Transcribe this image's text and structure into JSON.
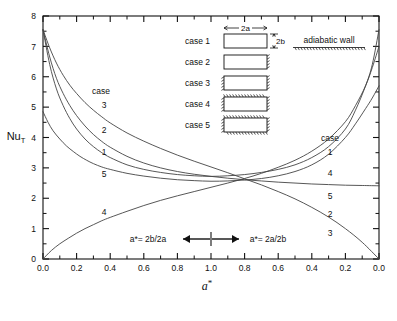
{
  "chart_data": {
    "type": "line",
    "title": "",
    "xlabel": "a*",
    "ylabel": "Nu_T",
    "ylim": [
      0,
      8
    ],
    "xlim": [
      0,
      2
    ],
    "grid": false,
    "legend_position": "on-curve-labels",
    "y_ticks": [
      "0",
      "1",
      "2",
      "3",
      "4",
      "5",
      "6",
      "7",
      "8"
    ],
    "y_tick_values": [
      0,
      1,
      2,
      3,
      4,
      5,
      6,
      7,
      8
    ],
    "x_ticks": [
      "0.0",
      "0.2",
      "0.4",
      "0.6",
      "0.8",
      "1.0",
      "0.8",
      "0.6",
      "0.4",
      "0.2",
      "0.0"
    ],
    "x_tick_values": [
      0.0,
      0.2,
      0.4,
      0.6,
      0.8,
      1.0,
      1.2,
      1.4,
      1.6,
      1.8,
      2.0
    ],
    "axis_note_left": "a*= 2b/2a",
    "axis_note_right": "a*= 2a/2b",
    "series": [
      {
        "name": "case 1",
        "label_left": "1",
        "label_right": "1",
        "points": [
          [
            0.0,
            7.55
          ],
          [
            0.04,
            6.4
          ],
          [
            0.08,
            5.6
          ],
          [
            0.12,
            5.05
          ],
          [
            0.16,
            4.62
          ],
          [
            0.2,
            4.28
          ],
          [
            0.25,
            3.95
          ],
          [
            0.3,
            3.7
          ],
          [
            0.35,
            3.5
          ],
          [
            0.4,
            3.34
          ],
          [
            0.5,
            3.1
          ],
          [
            0.6,
            2.95
          ],
          [
            0.7,
            2.85
          ],
          [
            0.8,
            2.78
          ],
          [
            0.9,
            2.74
          ],
          [
            1.0,
            2.72
          ],
          [
            1.1,
            2.74
          ],
          [
            1.2,
            2.78
          ],
          [
            1.3,
            2.85
          ],
          [
            1.4,
            2.95
          ],
          [
            1.5,
            3.1
          ],
          [
            1.6,
            3.34
          ],
          [
            1.7,
            3.7
          ],
          [
            1.8,
            4.28
          ],
          [
            1.86,
            4.9
          ],
          [
            1.92,
            5.7
          ],
          [
            1.96,
            6.4
          ],
          [
            2.0,
            7.55
          ]
        ]
      },
      {
        "name": "case 2",
        "label_left": "2",
        "label_right": "2",
        "points": [
          [
            0.0,
            7.55
          ],
          [
            0.04,
            6.65
          ],
          [
            0.08,
            5.95
          ],
          [
            0.12,
            5.45
          ],
          [
            0.16,
            5.05
          ],
          [
            0.2,
            4.72
          ],
          [
            0.25,
            4.38
          ],
          [
            0.3,
            4.1
          ],
          [
            0.35,
            3.87
          ],
          [
            0.4,
            3.68
          ],
          [
            0.5,
            3.38
          ],
          [
            0.6,
            3.16
          ],
          [
            0.7,
            3.0
          ],
          [
            0.8,
            2.88
          ],
          [
            0.9,
            2.79
          ],
          [
            1.0,
            2.72
          ],
          [
            1.1,
            2.66
          ],
          [
            1.2,
            2.61
          ],
          [
            1.3,
            2.57
          ],
          [
            1.4,
            2.53
          ],
          [
            1.5,
            2.5
          ],
          [
            1.6,
            2.47
          ],
          [
            1.7,
            2.45
          ],
          [
            1.8,
            2.43
          ],
          [
            1.9,
            2.42
          ],
          [
            2.0,
            2.41
          ]
        ]
      },
      {
        "name": "case 3",
        "label_left": "3",
        "label_right": "3",
        "points": [
          [
            0.0,
            7.55
          ],
          [
            0.04,
            6.95
          ],
          [
            0.08,
            6.45
          ],
          [
            0.12,
            6.05
          ],
          [
            0.16,
            5.72
          ],
          [
            0.2,
            5.45
          ],
          [
            0.25,
            5.15
          ],
          [
            0.3,
            4.9
          ],
          [
            0.35,
            4.68
          ],
          [
            0.4,
            4.48
          ],
          [
            0.5,
            4.15
          ],
          [
            0.6,
            3.88
          ],
          [
            0.7,
            3.64
          ],
          [
            0.8,
            3.42
          ],
          [
            0.9,
            3.22
          ],
          [
            1.0,
            3.03
          ],
          [
            1.1,
            2.84
          ],
          [
            1.2,
            2.64
          ],
          [
            1.3,
            2.44
          ],
          [
            1.4,
            2.22
          ],
          [
            1.5,
            1.98
          ],
          [
            1.6,
            1.7
          ],
          [
            1.7,
            1.38
          ],
          [
            1.8,
            1.0
          ],
          [
            1.9,
            0.55
          ],
          [
            2.0,
            0.0
          ]
        ]
      },
      {
        "name": "case 4",
        "label_left": "4",
        "label_right": "4",
        "points": [
          [
            0.0,
            0.0
          ],
          [
            0.05,
            0.28
          ],
          [
            0.1,
            0.5
          ],
          [
            0.15,
            0.68
          ],
          [
            0.2,
            0.85
          ],
          [
            0.25,
            1.0
          ],
          [
            0.3,
            1.13
          ],
          [
            0.35,
            1.26
          ],
          [
            0.4,
            1.37
          ],
          [
            0.5,
            1.57
          ],
          [
            0.6,
            1.76
          ],
          [
            0.7,
            1.93
          ],
          [
            0.8,
            2.08
          ],
          [
            0.9,
            2.22
          ],
          [
            1.0,
            2.36
          ],
          [
            1.1,
            2.5
          ],
          [
            1.2,
            2.65
          ],
          [
            1.3,
            2.82
          ],
          [
            1.4,
            3.02
          ],
          [
            1.5,
            3.25
          ],
          [
            1.6,
            3.55
          ],
          [
            1.7,
            3.95
          ],
          [
            1.8,
            4.52
          ],
          [
            1.86,
            5.05
          ],
          [
            1.92,
            5.7
          ],
          [
            1.96,
            6.3
          ],
          [
            2.0,
            7.0
          ]
        ]
      },
      {
        "name": "case 5",
        "label_left": "5",
        "label_right": "5",
        "points": [
          [
            0.0,
            4.85
          ],
          [
            0.03,
            4.5
          ],
          [
            0.06,
            4.22
          ],
          [
            0.1,
            3.95
          ],
          [
            0.14,
            3.72
          ],
          [
            0.18,
            3.54
          ],
          [
            0.22,
            3.38
          ],
          [
            0.26,
            3.25
          ],
          [
            0.3,
            3.14
          ],
          [
            0.35,
            3.03
          ],
          [
            0.4,
            2.95
          ],
          [
            0.5,
            2.82
          ],
          [
            0.6,
            2.73
          ],
          [
            0.7,
            2.66
          ],
          [
            0.8,
            2.61
          ],
          [
            0.9,
            2.58
          ],
          [
            1.0,
            2.56
          ],
          [
            1.1,
            2.57
          ],
          [
            1.2,
            2.6
          ],
          [
            1.3,
            2.65
          ],
          [
            1.4,
            2.74
          ],
          [
            1.5,
            2.88
          ],
          [
            1.6,
            3.1
          ],
          [
            1.7,
            3.45
          ],
          [
            1.8,
            4.0
          ],
          [
            1.86,
            4.45
          ],
          [
            1.92,
            4.95
          ],
          [
            1.96,
            5.3
          ],
          [
            2.0,
            5.7
          ]
        ]
      }
    ],
    "curve_label_header_left": "case",
    "curve_label_header_right": "case"
  },
  "legend": {
    "dim_width_label": "2a",
    "dim_height_label": "2b",
    "adiabatic_label": "adiabatic  wall",
    "cases": [
      {
        "label": "case  1",
        "adiabatic": {
          "top": false,
          "bottom": false,
          "left": false,
          "right": false
        }
      },
      {
        "label": "case  2",
        "adiabatic": {
          "top": false,
          "bottom": false,
          "left": false,
          "right": true
        }
      },
      {
        "label": "case  3",
        "adiabatic": {
          "top": false,
          "bottom": false,
          "left": true,
          "right": true
        }
      },
      {
        "label": "case  4",
        "adiabatic": {
          "top": true,
          "bottom": false,
          "left": true,
          "right": true
        }
      },
      {
        "label": "case  5",
        "adiabatic": {
          "top": true,
          "bottom": true,
          "left": true,
          "right": true
        }
      }
    ]
  },
  "colors": {
    "ink": "#111111",
    "curve": "#444444",
    "background": "#ffffff"
  }
}
